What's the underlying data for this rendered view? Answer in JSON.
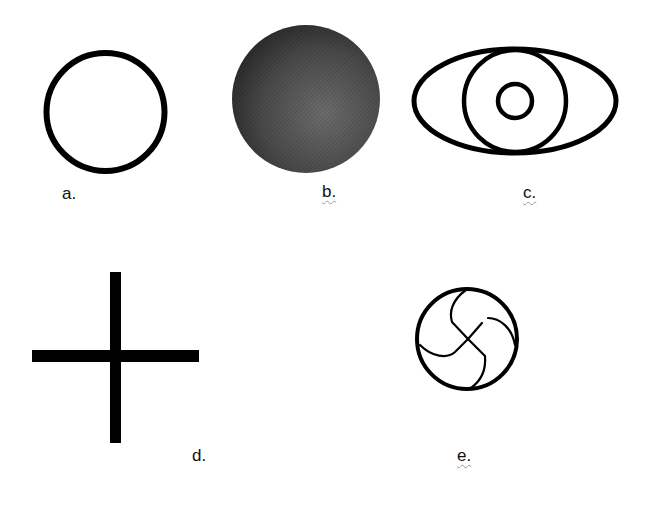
{
  "figures": [
    {
      "id": "a",
      "label": "a.",
      "description": "open circle"
    },
    {
      "id": "b",
      "label": "b.",
      "description": "filled shaded circle"
    },
    {
      "id": "c",
      "label": "c.",
      "description": "eye shape: ellipse with circle and inner small circle"
    },
    {
      "id": "d",
      "label": "d.",
      "description": "cross"
    },
    {
      "id": "e",
      "label": "e.",
      "description": "circle with swirl cross"
    }
  ],
  "colors": {
    "stroke": "#000000",
    "fill_dark": "#3a3a3a",
    "fill_light": "#6a6a6a",
    "background": "#ffffff"
  }
}
